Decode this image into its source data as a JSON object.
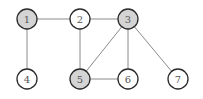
{
  "graph": {
    "colors": {
      "shaded_fill": "#d4d4d4",
      "unshaded_fill": "#ffffff",
      "edge": "#8a8a8a",
      "stroke": "#2a2a2a"
    },
    "nodes": [
      {
        "id": "1",
        "label": "1",
        "x": 27,
        "y": 19,
        "shaded": true
      },
      {
        "id": "2",
        "label": "2",
        "x": 80,
        "y": 19,
        "shaded": false
      },
      {
        "id": "3",
        "label": "3",
        "x": 128,
        "y": 19,
        "shaded": true
      },
      {
        "id": "4",
        "label": "4",
        "x": 27,
        "y": 79,
        "shaded": false
      },
      {
        "id": "5",
        "label": "5",
        "x": 80,
        "y": 79,
        "shaded": true
      },
      {
        "id": "6",
        "label": "6",
        "x": 128,
        "y": 79,
        "shaded": false
      },
      {
        "id": "7",
        "label": "7",
        "x": 178,
        "y": 79,
        "shaded": false
      }
    ],
    "edges": [
      [
        "1",
        "2"
      ],
      [
        "2",
        "3"
      ],
      [
        "1",
        "4"
      ],
      [
        "2",
        "5"
      ],
      [
        "3",
        "5"
      ],
      [
        "3",
        "6"
      ],
      [
        "5",
        "6"
      ],
      [
        "3",
        "7"
      ]
    ],
    "node_radius": 10
  }
}
